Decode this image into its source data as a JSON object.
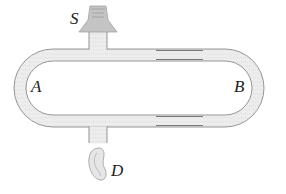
{
  "diagram": {
    "labels": {
      "source": "S",
      "left_arm": "A",
      "right_arm": "B",
      "detector": "D"
    },
    "components": [
      {
        "id": "source",
        "description": "speaker/sound source at top feeding a vertical stem",
        "label": "S"
      },
      {
        "id": "left-arm",
        "description": "fixed semicircular left path of tube",
        "label": "A"
      },
      {
        "id": "right-arm",
        "description": "sliding U-shaped right path of tube (telescoping section)",
        "label": "B"
      },
      {
        "id": "detector",
        "description": "ear at bottom outlet stem",
        "label": "D"
      }
    ],
    "colors": {
      "tube_fill": "#ececec",
      "tube_stroke": "#8a8a8a",
      "slide_stroke": "#7a7a7a",
      "label": "#222222"
    }
  }
}
